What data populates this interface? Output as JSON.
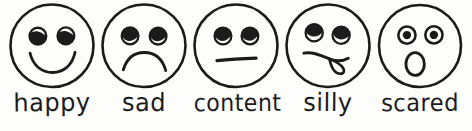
{
  "diagram": {
    "background_color": "#fdfdfc",
    "ink_color": "#1b1b1b",
    "style": "hand-drawn black ink line art",
    "count": 5
  },
  "faces": [
    {
      "id": "happy",
      "label": "happy",
      "icon_name": "smiley-happy-face-icon",
      "mouth": "upward smile arc",
      "eyes": "two round eyes filled dark with white highlight at upper-left"
    },
    {
      "id": "sad",
      "label": "sad",
      "icon_name": "smiley-sad-face-icon",
      "mouth": "downward frown arc",
      "eyes": "two round eyes with dark upper half and light lower crescent"
    },
    {
      "id": "content",
      "label": "content",
      "icon_name": "smiley-content-face-icon",
      "mouth": "straight horizontal line",
      "eyes": "two round eyes with dark upper half and light lower crescent"
    },
    {
      "id": "silly",
      "label": "silly",
      "icon_name": "smiley-silly-face-icon",
      "mouth": "wavy mouth with tongue sticking out to the right",
      "eyes": "two tilted rolled eyes looking in different directions"
    },
    {
      "id": "scared",
      "label": "scared",
      "icon_name": "smiley-scared-face-icon",
      "mouth": "small open oval O shape",
      "eyes": "two concentric ring eyes with dark pupil centers"
    }
  ]
}
